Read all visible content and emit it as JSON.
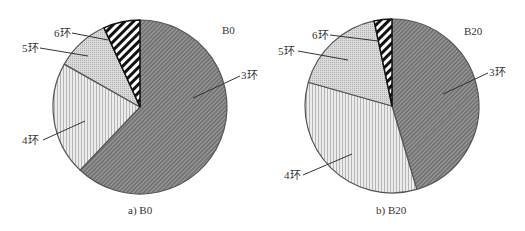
{
  "chart_data": [
    {
      "type": "pie",
      "title": "B0",
      "caption": "a) B0",
      "categories": [
        "3环",
        "4环",
        "5环",
        "6环"
      ],
      "values": [
        62.1,
        21.1,
        10.0,
        6.8
      ],
      "start_angle": "12 o'clock, clockwise",
      "legend": "none (leader-line labels)",
      "patterns": {
        "3环": "dense dark diagonal hatch",
        "4环": "light vertical stripes",
        "5环": "light grey stippled vertical",
        "6环": "bold black/white diagonal stripes"
      }
    },
    {
      "type": "pie",
      "title": "B20",
      "caption": "b) B20",
      "categories": [
        "3环",
        "4环",
        "5环",
        "6环"
      ],
      "values": [
        45.4,
        34.0,
        17.3,
        3.3
      ],
      "start_angle": "12 o'clock, clockwise",
      "legend": "none (leader-line labels)",
      "patterns": {
        "3环": "dense dark diagonal hatch",
        "4环": "light vertical stripes",
        "5环": "light grey stippled vertical",
        "6环": "bold black/white diagonal stripes"
      }
    }
  ],
  "charts": {
    "left": {
      "title": "B0",
      "caption": "a) B0",
      "labels": {
        "s3": "3环",
        "s4": "4环",
        "s5": "5环",
        "s6": "6环"
      }
    },
    "right": {
      "title": "B20",
      "caption": "b) B20",
      "labels": {
        "s3": "3环",
        "s4": "4环",
        "s5": "5环",
        "s6": "6环"
      }
    }
  },
  "colors": {
    "outline": "#555555",
    "s3_bg": "#8a8a8a",
    "s4_bg": "#e6e6e6",
    "s5_bg": "#d0d0d0",
    "s6_bg": "#ffffff"
  }
}
